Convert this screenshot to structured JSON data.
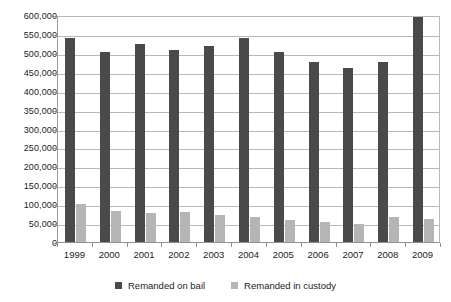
{
  "chart_data": {
    "type": "bar",
    "title": "",
    "subtitle": "",
    "xlabel": "",
    "ylabel": "",
    "categories": [
      "1999",
      "2000",
      "2001",
      "2002",
      "2003",
      "2004",
      "2005",
      "2006",
      "2007",
      "2008",
      "2009"
    ],
    "series": [
      {
        "name": "Remanded on bail",
        "color": "#4a4a4a",
        "values": [
          540000,
          503000,
          524000,
          508000,
          519000,
          540000,
          503000,
          476000,
          461000,
          475000,
          595000
        ]
      },
      {
        "name": "Remanded in custody",
        "color": "#b5b5b5",
        "values": [
          100000,
          83000,
          76000,
          80000,
          72000,
          65000,
          58000,
          52000,
          48000,
          65000,
          60000
        ]
      }
    ],
    "ylim": [
      0,
      600000
    ],
    "ytick_values": [
      0,
      50000,
      100000,
      150000,
      200000,
      250000,
      300000,
      350000,
      400000,
      450000,
      500000,
      550000,
      600000
    ],
    "ytick_labels": [
      "0",
      "50,000",
      "100,000",
      "150,000",
      "200,000",
      "250,000",
      "300,000",
      "350,000",
      "400,000",
      "450,000",
      "500,000",
      "550,000",
      "600,000"
    ],
    "grid": true,
    "grid_axis": "y",
    "legend_position": "bottom",
    "legend": [
      "Remanded on bail",
      "Remanded in custody"
    ]
  }
}
